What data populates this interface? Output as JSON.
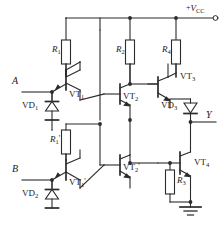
{
  "diagram": {
    "type": "schematic",
    "style": {
      "wire_color": "#2b2b2b",
      "background": "#ffffff",
      "label_color": "#1a1a1a"
    },
    "power_rail": {
      "label": "+V",
      "sub": "CC",
      "terminal": "open-circle"
    },
    "ground": {
      "symbol": "earth-ground"
    },
    "inputs": [
      {
        "name": "A",
        "label": "A"
      },
      {
        "name": "B",
        "label": "B"
      }
    ],
    "outputs": [
      {
        "name": "Y",
        "label": "Y"
      }
    ],
    "resistors": [
      {
        "id": "R1",
        "label": "R",
        "sub": "1",
        "prime": ""
      },
      {
        "id": "R2",
        "label": "R",
        "sub": "2",
        "prime": ""
      },
      {
        "id": "R4",
        "label": "R",
        "sub": "4",
        "prime": ""
      },
      {
        "id": "R1p",
        "label": "R",
        "sub": "1",
        "prime": "'"
      },
      {
        "id": "R3",
        "label": "R",
        "sub": "3",
        "prime": ""
      }
    ],
    "transistors": [
      {
        "id": "VT1",
        "label": "VT",
        "sub": "1",
        "prime": "",
        "kind": "npn-multi-emitter"
      },
      {
        "id": "VT2",
        "label": "VT",
        "sub": "2",
        "prime": "",
        "kind": "npn"
      },
      {
        "id": "VT3",
        "label": "VT",
        "sub": "3",
        "prime": "",
        "kind": "npn"
      },
      {
        "id": "VT1p",
        "label": "VT",
        "sub": "1",
        "prime": "'",
        "kind": "npn-multi-emitter"
      },
      {
        "id": "VT2p",
        "label": "VT",
        "sub": "2",
        "prime": "'",
        "kind": "npn"
      },
      {
        "id": "VT4",
        "label": "VT",
        "sub": "4",
        "prime": "",
        "kind": "npn"
      }
    ],
    "diodes": [
      {
        "id": "VD1",
        "label": "VD",
        "sub": "1",
        "orientation": "up"
      },
      {
        "id": "VD2",
        "label": "VD",
        "sub": "2",
        "orientation": "up"
      },
      {
        "id": "VD3",
        "label": "VD",
        "sub": "3",
        "orientation": "down"
      }
    ]
  }
}
